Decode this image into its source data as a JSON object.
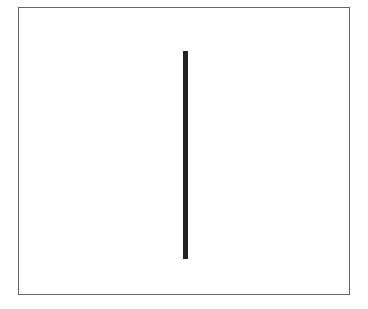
{
  "diagram": {
    "frame": {
      "border_color": "#666666",
      "background": "#ffffff"
    },
    "line": {
      "orientation": "vertical",
      "color": "#222222"
    }
  }
}
